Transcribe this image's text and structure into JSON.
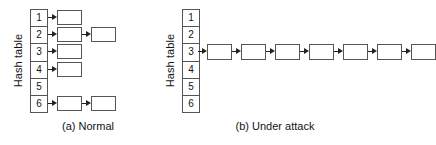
{
  "figure": {
    "panels": [
      {
        "id": "a",
        "caption": "(a) Normal",
        "axis_label": "Hash table",
        "slots": [
          {
            "label": "1",
            "chain_length": 1
          },
          {
            "label": "2",
            "chain_length": 2
          },
          {
            "label": "3",
            "chain_length": 1
          },
          {
            "label": "4",
            "chain_length": 1
          },
          {
            "label": "5",
            "chain_length": 0
          },
          {
            "label": "6",
            "chain_length": 2
          }
        ]
      },
      {
        "id": "b",
        "caption": "(b) Under attack",
        "axis_label": "Hash table",
        "slots": [
          {
            "label": "1",
            "chain_length": 0
          },
          {
            "label": "2",
            "chain_length": 0
          },
          {
            "label": "3",
            "chain_length": 7
          },
          {
            "label": "4",
            "chain_length": 0
          },
          {
            "label": "5",
            "chain_length": 0
          },
          {
            "label": "6",
            "chain_length": 0
          }
        ]
      }
    ],
    "colors": {
      "stroke": "#555555",
      "arrow": "#222222",
      "fill": "#ffffff",
      "text": "#141414"
    }
  }
}
